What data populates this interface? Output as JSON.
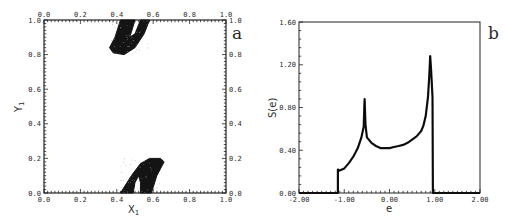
{
  "chart_data": [
    {
      "id": "a",
      "type": "scatter",
      "panel_label": "a",
      "title": "",
      "xlabel": "X1",
      "ylabel": "Y1",
      "xlim": [
        0.0,
        1.0
      ],
      "ylim": [
        0.0,
        1.0
      ],
      "xticks": [
        "0.0",
        "0.2",
        "0.4",
        "0.6",
        "0.8",
        "1.0"
      ],
      "yticks": [
        "0.0",
        "0.2",
        "0.4",
        "0.6",
        "0.8",
        "1.0"
      ],
      "top_axis_ticks": [
        "0.0",
        "0.2",
        "0.4",
        "0.6",
        "0.8",
        "1.0"
      ],
      "right_axis_ticks": [
        "0.0",
        "0.2",
        "0.4",
        "0.6",
        "0.8",
        "1.0"
      ],
      "grid": false,
      "description": "Dense point set forming two horseshoe-shaped bands: one hanging from the top edge (x ≈ 0.36–0.58, y ≈ 0.80–1.00) and one rising from the bottom edge (x ≈ 0.42–0.66, y ≈ 0.00–0.20).",
      "regions": [
        {
          "name": "upper-band",
          "x_range": [
            0.36,
            0.58
          ],
          "y_range": [
            0.8,
            1.0
          ]
        },
        {
          "name": "lower-band",
          "x_range": [
            0.42,
            0.66
          ],
          "y_range": [
            0.0,
            0.2
          ]
        }
      ]
    },
    {
      "id": "b",
      "type": "line",
      "panel_label": "b",
      "title": "",
      "xlabel": "e",
      "ylabel": "S(e)",
      "xlim": [
        -2.0,
        2.0
      ],
      "ylim": [
        0.0,
        1.6
      ],
      "xticks": [
        "-2.00",
        "-1.00",
        "0.00",
        "1.00",
        "2.00"
      ],
      "yticks": [
        "0.00",
        "0.40",
        "0.80",
        "1.20",
        "1.60"
      ],
      "grid": false,
      "series": [
        {
          "name": "S(e)",
          "x": [
            -2.0,
            -1.14,
            -1.14,
            -1.1,
            -1.0,
            -0.9,
            -0.8,
            -0.7,
            -0.62,
            -0.57,
            -0.55,
            -0.53,
            -0.5,
            -0.4,
            -0.3,
            -0.2,
            -0.1,
            0.0,
            0.1,
            0.2,
            0.3,
            0.4,
            0.5,
            0.6,
            0.7,
            0.75,
            0.8,
            0.85,
            0.88,
            0.9,
            0.92,
            0.95,
            0.96,
            2.0
          ],
          "values": [
            0.0,
            0.0,
            0.22,
            0.21,
            0.23,
            0.28,
            0.34,
            0.42,
            0.52,
            0.62,
            0.88,
            0.64,
            0.52,
            0.47,
            0.44,
            0.42,
            0.42,
            0.42,
            0.43,
            0.44,
            0.45,
            0.47,
            0.5,
            0.53,
            0.58,
            0.63,
            0.72,
            0.9,
            1.1,
            1.28,
            1.15,
            0.9,
            0.0,
            0.0
          ]
        }
      ]
    }
  ]
}
